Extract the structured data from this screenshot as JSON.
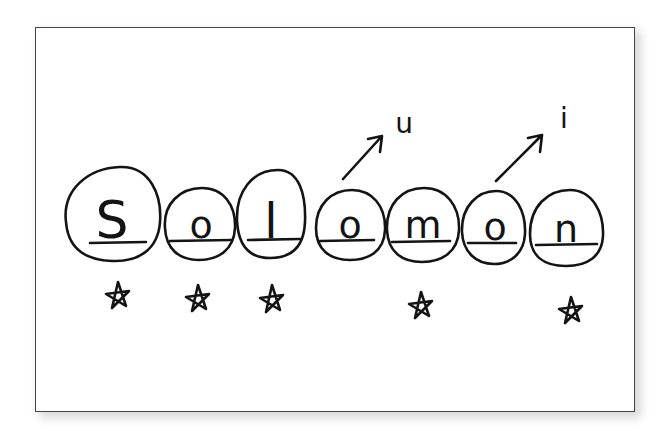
{
  "word": "Solomon",
  "letters": [
    {
      "char": "S",
      "starred": true
    },
    {
      "char": "o",
      "starred": true
    },
    {
      "char": "l",
      "starred": true
    },
    {
      "char": "o",
      "starred": false,
      "arrow_to": "u"
    },
    {
      "char": "m",
      "starred": true
    },
    {
      "char": "o",
      "starred": false,
      "arrow_to": "i"
    },
    {
      "char": "n",
      "starred": true
    }
  ],
  "annotations": [
    {
      "from_letter_index": 3,
      "text": "u"
    },
    {
      "from_letter_index": 5,
      "text": "i"
    }
  ],
  "colors": {
    "ink": "#141414",
    "card_border": "#444444",
    "shadow": "#cfcfcf"
  }
}
